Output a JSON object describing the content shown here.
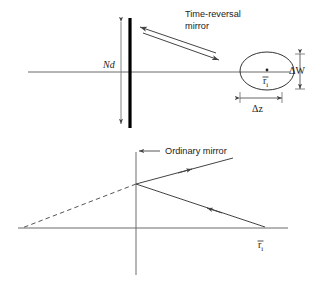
{
  "figure": {
    "title": "",
    "background_color": "#ffffff",
    "line_color": "#555555",
    "mirror_color": "#000000",
    "text_color": "#1c1c1c"
  },
  "top_panel": {
    "caption": {
      "line1": "Time-reversal",
      "line2": "mirror"
    },
    "mirror_height_label": "Nd",
    "axis_label": "",
    "scatterer": {
      "center_label_base": "r",
      "center_label_sub": "i",
      "center_label_overbar": "¯",
      "center_label_full": "r̄ᵢ"
    },
    "dimension_vertical_label": "ΔW",
    "dimension_horizontal_label": "Δz"
  },
  "bottom_panel": {
    "caption": "Ordinary mirror",
    "point_label_base": "r",
    "point_label_sub": "i",
    "point_label_full": "r̄ᵢ"
  }
}
